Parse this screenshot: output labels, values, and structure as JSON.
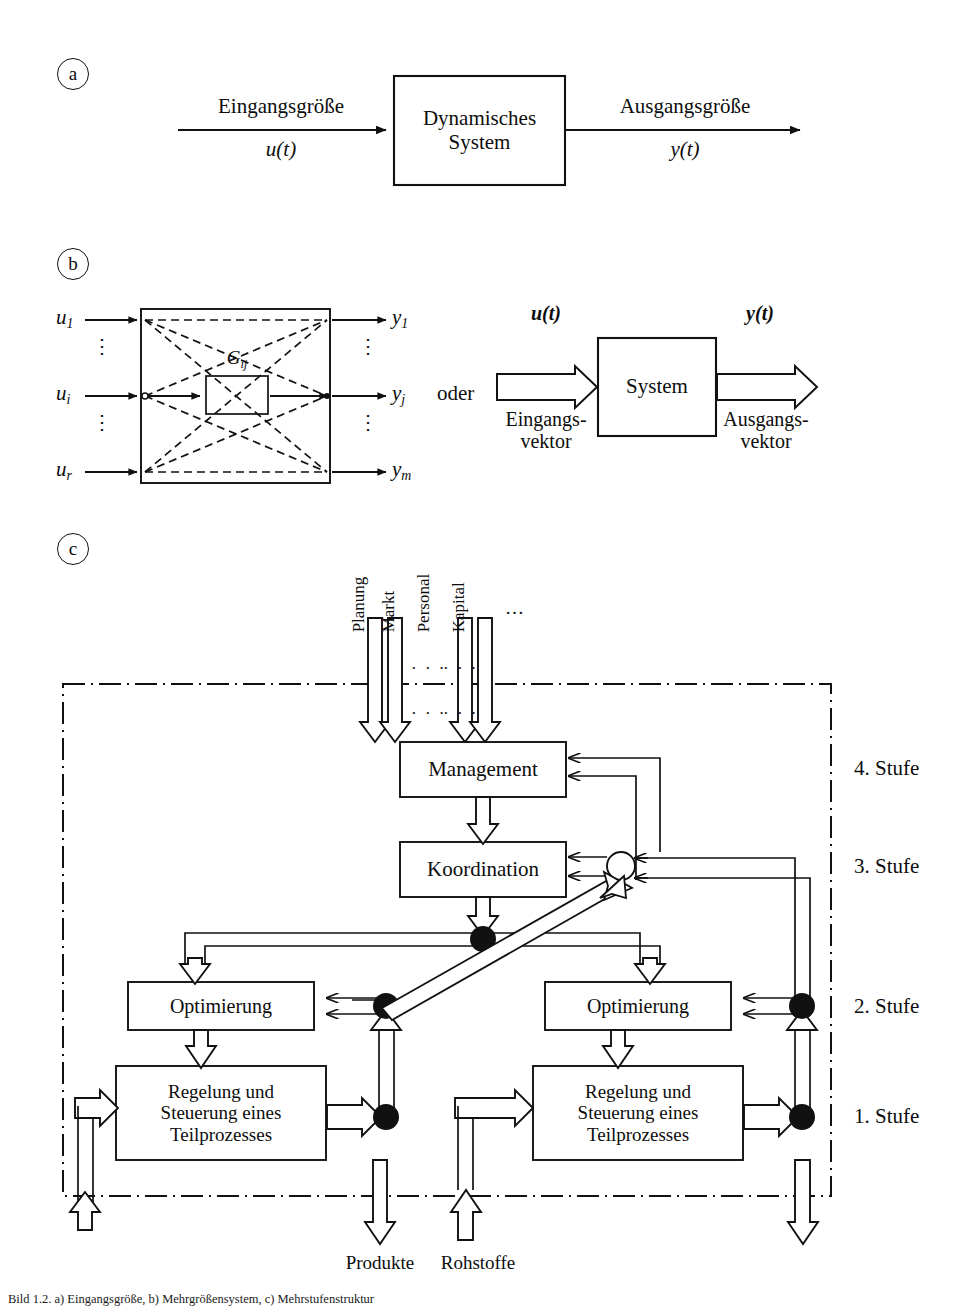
{
  "figure": {
    "panels": [
      "a",
      "b",
      "c"
    ],
    "caption": "Bild 1.2. a) Eingangsgröße, b) Mehrgrößensystem, c) Mehrstufenstruktur"
  },
  "panel_a": {
    "tag": "a",
    "input_label": "Eingangsgröße",
    "input_signal": "u(t)",
    "block_line1": "Dynamisches",
    "block_line2": "System",
    "output_label": "Ausgangsgröße",
    "output_signal": "y(t)"
  },
  "panel_b": {
    "tag": "b",
    "inputs": [
      "u",
      "u",
      "u"
    ],
    "input_subs": [
      "1",
      "i",
      "r"
    ],
    "outputs": [
      "y",
      "y",
      "y"
    ],
    "output_subs": [
      "1",
      "j",
      "m"
    ],
    "inner_block_label": "G",
    "inner_block_sub": "ij",
    "vdots": "⋮",
    "conjunction": "oder",
    "vector_input_signal": "u(t)",
    "vector_output_signal": "y(t)",
    "vector_block_label": "System",
    "vector_input_name_l1": "Eingangs-",
    "vector_input_name_l2": "vektor",
    "vector_output_name_l1": "Ausgangs-",
    "vector_output_name_l2": "vektor"
  },
  "panel_c": {
    "tag": "c",
    "top_inputs": [
      "Planung",
      "Markt",
      "Personal",
      "Kapital"
    ],
    "top_ellipsis": "…",
    "inner_ellipsis_left": "· · ·",
    "inner_ellipsis_right": "· · ·",
    "blocks": {
      "management": "Management",
      "koordination": "Koordination",
      "optimierung_left": "Optimierung",
      "optimierung_right": "Optimierung",
      "regelung_left_l1": "Regelung und",
      "regelung_left_l2": "Steuerung eines",
      "regelung_left_l3": "Teilprozesses",
      "regelung_right_l1": "Regelung und",
      "regelung_right_l2": "Steuerung eines",
      "regelung_right_l3": "Teilprozesses"
    },
    "stages": [
      "4. Stufe",
      "3. Stufe",
      "2. Stufe",
      "1. Stufe"
    ],
    "bottom_labels": [
      "Produkte",
      "Rohstoffe"
    ]
  },
  "colors": {
    "line": "#111111",
    "fill": "#ffffff",
    "node_filled": "#000000",
    "node_hollow": "#ffffff",
    "background": "#ffffff"
  }
}
